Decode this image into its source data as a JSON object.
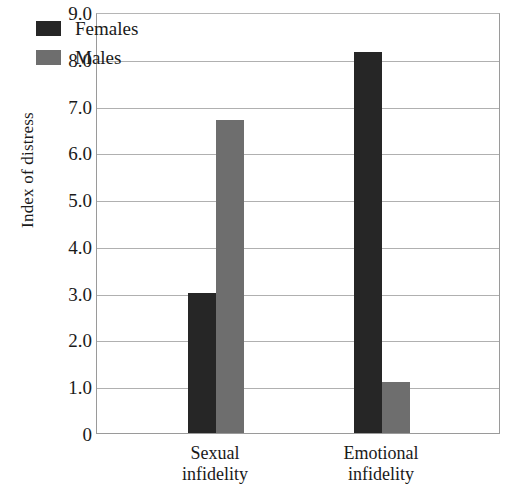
{
  "chart_data": {
    "type": "bar",
    "title": "",
    "xlabel": "",
    "ylabel": "Index of distress",
    "categories": [
      "Sexual infidelity",
      "Emotional infidelity"
    ],
    "category_lines": [
      [
        "Sexual",
        "infidelity"
      ],
      [
        "Emotional",
        "infidelity"
      ]
    ],
    "series": [
      {
        "name": "Females",
        "color": "#262626",
        "values": [
          3.0,
          8.15
        ]
      },
      {
        "name": "Males",
        "color": "#6e6e6e",
        "values": [
          6.7,
          1.1
        ]
      }
    ],
    "ylim": [
      0,
      9
    ],
    "ytick_values": [
      9,
      8,
      7,
      6,
      5,
      4,
      3,
      2,
      1,
      0
    ],
    "ytick_labels": [
      "9.0",
      "8.0",
      "7.0",
      "6.0",
      "5.0",
      "4.0",
      "3.0",
      "2.0",
      "1.0",
      "0"
    ],
    "grid": true,
    "grid_axis": "y",
    "legend_position": "top-left-inside",
    "legend_entries": [
      "Females",
      "Males"
    ]
  }
}
